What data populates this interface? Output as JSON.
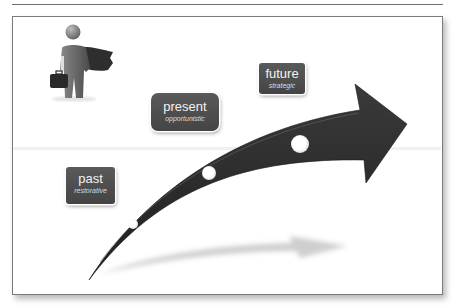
{
  "diagram": {
    "title": "",
    "colors": {
      "arrow": "#2b2b2b",
      "label_bg": "#4e4e4e",
      "label_text": "#f2f2f2",
      "shadow": "#cfcfcf",
      "frame": "#7a7a7a"
    },
    "icons": {
      "figure": "superhero-businessman-icon",
      "arrow": "growth-arrow-icon"
    },
    "stages": [
      {
        "title": "past",
        "subtitle": "restorative"
      },
      {
        "title": "present",
        "subtitle": "opportunistic"
      },
      {
        "title": "future",
        "subtitle": "strategic"
      }
    ]
  }
}
